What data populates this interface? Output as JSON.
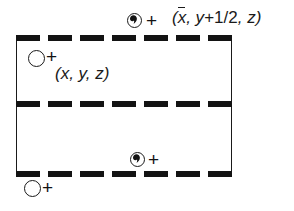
{
  "diagram": {
    "type": "crystallographic-space-group-unit-cell-diagram",
    "title": "",
    "cell": {
      "left": 16,
      "top": 38,
      "width": 216,
      "height": 136,
      "vertical_edges": "solid-thin",
      "horizontal_edges": "thick-dashed-glide-planes",
      "dash_count": 7
    },
    "glide_lines": [
      {
        "name": "top-glide-plane",
        "y": 35
      },
      {
        "name": "middle-glide-plane",
        "y": 101
      },
      {
        "name": "bottom-glide-plane",
        "y": 171
      }
    ],
    "symbols": [
      {
        "id": "general-position-open-upper",
        "kind": "open-circle",
        "handedness": "normal",
        "height_sign": "+",
        "x": 28,
        "y": 50
      },
      {
        "id": "general-position-comma-upper",
        "kind": "circle-with-comma",
        "handedness": "enantiomorph",
        "height_sign": "+",
        "x": 127,
        "y": 13
      },
      {
        "id": "general-position-comma-lower",
        "kind": "circle-with-comma",
        "handedness": "enantiomorph",
        "height_sign": "+",
        "x": 130,
        "y": 152
      },
      {
        "id": "general-position-open-lower",
        "kind": "open-circle",
        "handedness": "normal",
        "height_sign": "+",
        "x": 24,
        "y": 180
      }
    ],
    "labels": [
      {
        "id": "coordinate-label-general",
        "text": "(x, y, z)",
        "parts": [
          {
            "t": "(",
            "style": "italic"
          },
          {
            "t": "x",
            "style": "italic"
          },
          {
            "t": ", ",
            "style": "italic"
          },
          {
            "t": "y",
            "style": "italic"
          },
          {
            "t": ", ",
            "style": "italic"
          },
          {
            "t": "z",
            "style": "italic"
          },
          {
            "t": ")",
            "style": "italic"
          }
        ],
        "x": 55,
        "y": 64
      },
      {
        "id": "coordinate-label-glide-image",
        "text": "(x̄, y+1/2, z)",
        "parts": [
          {
            "t": "(",
            "style": "italic"
          },
          {
            "t": "x",
            "style": "italic-overbar"
          },
          {
            "t": ", ",
            "style": "italic"
          },
          {
            "t": "y",
            "style": "italic"
          },
          {
            "t": "+1/2",
            "style": "upright"
          },
          {
            "t": ", ",
            "style": "italic"
          },
          {
            "t": "z",
            "style": "italic"
          },
          {
            "t": ")",
            "style": "italic"
          }
        ],
        "x": 172,
        "y": 8
      }
    ],
    "plus_signs": [
      {
        "id": "plus-upper-open",
        "x": 46,
        "y": 47
      },
      {
        "id": "plus-upper-comma",
        "x": 146,
        "y": 11
      },
      {
        "id": "plus-lower-comma",
        "x": 148,
        "y": 150
      },
      {
        "id": "plus-lower-open",
        "x": 42,
        "y": 178
      }
    ],
    "colors": {
      "ink": "#1a1a1a",
      "dash": "#131313",
      "background": "#ffffff"
    }
  }
}
